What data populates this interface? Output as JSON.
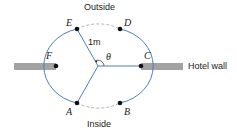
{
  "diagram": {
    "labels": {
      "outside": "Outside",
      "inside": "Inside",
      "hotel_wall": "Hotel wall",
      "radius": "1m",
      "angle": "θ"
    },
    "points": [
      {
        "id": "A",
        "label": "A"
      },
      {
        "id": "B",
        "label": "B"
      },
      {
        "id": "C",
        "label": "C"
      },
      {
        "id": "D",
        "label": "D"
      },
      {
        "id": "E",
        "label": "E"
      },
      {
        "id": "F",
        "label": "F"
      }
    ],
    "colors": {
      "circle": "#4a7fc1",
      "dashed_arc": "#9a9a9a",
      "wall": "#9e9e9e",
      "point": "#111111"
    }
  }
}
